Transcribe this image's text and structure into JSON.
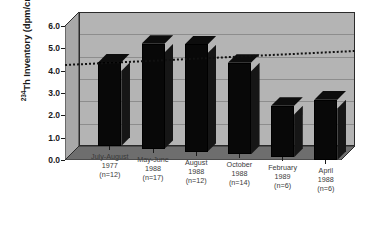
{
  "chart_data": {
    "type": "bar",
    "title": "",
    "xlabel": "",
    "ylabel": "234Th Inventory (dpm/cm)2",
    "ylabel_prefix": "234",
    "ylabel_main": "Th Inventory (dpm/cm)",
    "ylabel_exponent": "2",
    "ylim": [
      0.0,
      6.0
    ],
    "ytick_labels": [
      "0.0",
      "1.0",
      "2.0",
      "3.0",
      "4.0",
      "5.0",
      "6.0"
    ],
    "ytick_values": [
      0.0,
      1.0,
      2.0,
      3.0,
      4.0,
      5.0,
      6.0
    ],
    "grid": true,
    "legend": "none",
    "projection": "3d",
    "categories": [
      "July-August\n1977\n(n=12)",
      "May-June\n1988\n(n=17)",
      "August\n1988\n(n=12)",
      "October\n1988\n(n=14)",
      "February\n1989\n(n=6)",
      "April\n1988\n(n=6)"
    ],
    "category_lines": [
      [
        "July-August",
        "1977",
        "(n=12)"
      ],
      [
        "May-June",
        "1988",
        "(n=17)"
      ],
      [
        "August",
        "1988",
        "(n=12)"
      ],
      [
        "October",
        "1988",
        "(n=14)"
      ],
      [
        "February",
        "1989",
        "(n=6)"
      ],
      [
        "April",
        "1988",
        "(n=6)"
      ]
    ],
    "sample_sizes": [
      12,
      17,
      12,
      14,
      6,
      6
    ],
    "values": [
      3.75,
      4.7,
      4.8,
      4.1,
      2.3,
      2.7
    ],
    "annotations": [
      {
        "name": "mean-reference-line",
        "type": "horizontal-dotted-line",
        "value": 4.3,
        "style": "dotted",
        "color": "#111111"
      }
    ],
    "colors": {
      "bar": "#080808",
      "bar_side": "#161616",
      "wall": "#b4b4b4",
      "floor": "#6e6e6e",
      "gridline": "#8d8d8d",
      "axis": "#1a1a1a",
      "text": "#3a3a3a",
      "background": "#ffffff"
    }
  }
}
